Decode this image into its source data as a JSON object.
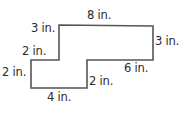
{
  "figure": {
    "type": "rectilinear-polygon",
    "stroke_color": "#555555",
    "vertices_px": [
      [
        59,
        25
      ],
      [
        153,
        26
      ],
      [
        153,
        60
      ],
      [
        87,
        60
      ],
      [
        87,
        88
      ],
      [
        31,
        88
      ],
      [
        31,
        60
      ],
      [
        59,
        60
      ]
    ],
    "labels": {
      "top": "8 in.",
      "upper_left_vertical": "3 in.",
      "right": "3 in.",
      "middle_left_horizontal": "2 in.",
      "lower_left_vertical": "2 in.",
      "middle_right_horizontal": "6 in.",
      "inner_vertical": "2 in.",
      "bottom": "4 in."
    }
  }
}
